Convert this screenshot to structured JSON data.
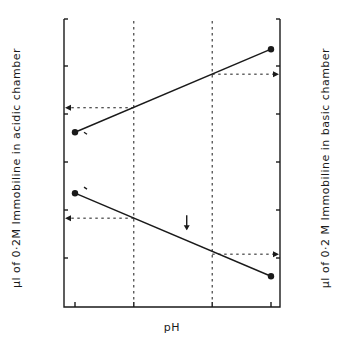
{
  "chart_data": {
    "type": "line",
    "title": "",
    "xlabel": "pH",
    "ylabel_left": "µl of 0·2M Immobiline in acidic chamber",
    "ylabel_right": "µl of 0·2 M Immobiline in basic chamber",
    "xlim": [
      6.8,
      7.8
    ],
    "ylim": [
      0,
      600
    ],
    "grid": false,
    "x_ticks": [
      {
        "value": 6.8,
        "label": "6·8"
      },
      {
        "value": 7.1,
        "label": "7·1"
      },
      {
        "value": 7.5,
        "label": "7·5"
      },
      {
        "value": 7.8,
        "label": "7·8"
      }
    ],
    "y_ticks_left": [
      {
        "value": 100,
        "label": "100"
      },
      {
        "value": 200,
        "label": "200"
      },
      {
        "value": 300,
        "label": "300"
      },
      {
        "value": 400,
        "label": "400"
      },
      {
        "value": 500,
        "label": "500"
      },
      {
        "value": 600,
        "label": "600"
      }
    ],
    "y_ticks_right": [
      {
        "value": 100,
        "label": "100"
      },
      {
        "value": 200,
        "label": "200"
      },
      {
        "value": 300,
        "label": "300"
      },
      {
        "value": 400,
        "label": "400"
      },
      {
        "value": 500,
        "label": "500"
      },
      {
        "value": 600,
        "label": "600"
      }
    ],
    "series": [
      {
        "name": "pK 7·0",
        "label": "pK 7·0",
        "x": [
          6.8,
          7.8
        ],
        "y": [
          362,
          535
        ]
      },
      {
        "name": "pK 3·6",
        "label": "pK 3·6",
        "x": [
          6.8,
          7.8
        ],
        "y": [
          235,
          62
        ]
      }
    ],
    "guides": {
      "vertical_ph": [
        7.1,
        7.5
      ],
      "horizontal_arrows": [
        {
          "from_ph": 7.1,
          "value": 413,
          "to": "left"
        },
        {
          "from_ph": 7.5,
          "value": 483,
          "to": "right"
        },
        {
          "from_ph": 7.1,
          "value": 183,
          "to": "left"
        },
        {
          "from_ph": 7.5,
          "value": 108,
          "to": "right"
        }
      ]
    },
    "annotations": [
      {
        "text": "pI of HbA",
        "ph": 7.37,
        "value": 160,
        "arrow": "down"
      }
    ]
  }
}
